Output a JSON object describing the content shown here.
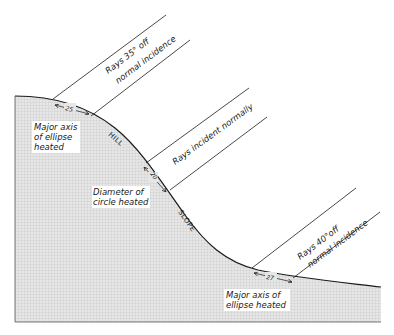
{
  "figure": {
    "type": "diagram"
  },
  "terrain_labels": {
    "hill": "HILL",
    "slope": "SLOPE"
  },
  "rays": [
    {
      "id": "rays-35",
      "label_line1": "Rays 35° off",
      "label_line2": "normal incidence",
      "measure": "25",
      "area_label_lines": [
        "Major axis",
        "of ellipse",
        "heated"
      ]
    },
    {
      "id": "rays-normal",
      "label_line1": "Rays incident normally",
      "label_line2": "",
      "measure": "20",
      "area_label_lines": [
        "Diameter of",
        "circle heated"
      ]
    },
    {
      "id": "rays-40",
      "label_line1": "Rays 40°off",
      "label_line2": "normal incidence",
      "measure": "27",
      "area_label_lines": [
        "Major axis of",
        "ellipse heated"
      ]
    }
  ],
  "colors": {
    "ground_fill": "#d9d9d9",
    "line": "#1a1a1a",
    "background": "#ffffff"
  }
}
